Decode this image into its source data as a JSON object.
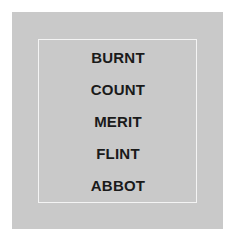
{
  "card": {
    "background": "#c9c9c9",
    "frame_color": "#f4f4f4"
  },
  "words": [
    "BURNT",
    "COUNT",
    "MERIT",
    "FLINT",
    "ABBOT"
  ]
}
